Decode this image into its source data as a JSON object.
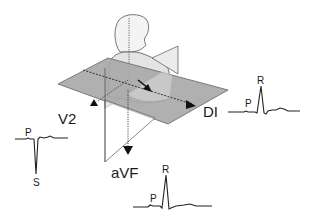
{
  "figure": {
    "colors": {
      "background": "#ffffff",
      "plane_fill": "#a9a9a9",
      "plane_front_fill": "#c4c4c4",
      "body_fill": "#e4e4e4",
      "line": "#333333",
      "text": "#1a1a1a"
    },
    "leads": {
      "di": {
        "label": "DI",
        "waves": {
          "p": "P",
          "r": "R"
        }
      },
      "v2": {
        "label": "V2",
        "waves": {
          "p": "P",
          "s": "S"
        }
      },
      "avf": {
        "label": "aVF",
        "waves": {
          "p": "P",
          "r": "R"
        }
      }
    }
  }
}
